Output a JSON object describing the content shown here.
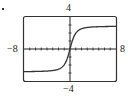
{
  "marker": "•",
  "chart_data": {
    "type": "line",
    "title": "",
    "xlabel": "",
    "ylabel": "",
    "xlim": [
      -8,
      8
    ],
    "ylim": [
      -4,
      4
    ],
    "x_tick_step": 1,
    "y_tick_step": 1,
    "grid": false,
    "window_labels": {
      "xmin": "−8",
      "xmax": "8",
      "ymin": "−4",
      "ymax": "4"
    },
    "series": [
      {
        "name": "f(x)",
        "description": "increasing S-shaped curve through origin, horizontal asymptotes near y≈±3",
        "x": [
          -8,
          -6,
          -4,
          -3,
          -2,
          -1,
          -0.5,
          0,
          0.5,
          1,
          2,
          3,
          4,
          6,
          8
        ],
        "y": [
          -2.8,
          -2.75,
          -2.6,
          -2.5,
          -2.2,
          -1.6,
          -0.9,
          0,
          0.9,
          1.6,
          2.2,
          2.5,
          2.6,
          2.75,
          2.8
        ]
      }
    ]
  },
  "colors": {
    "frame": "#333333",
    "axis": "#222222",
    "curve": "#333333",
    "background": "#ffffff"
  }
}
